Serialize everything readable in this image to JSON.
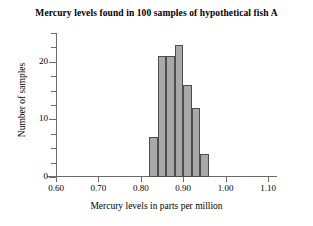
{
  "chart_data": {
    "type": "bar",
    "title": "Mercury levels found in 100 samples of hypothetical fish A",
    "xlabel": "Mercury levels in parts per million",
    "ylabel": "Number of samples",
    "xlim": [
      0.6,
      1.1
    ],
    "ylim": [
      0,
      25
    ],
    "grid": false,
    "legend": null,
    "bin_width": 0.02,
    "bin_starts": [
      0.82,
      0.84,
      0.86,
      0.88,
      0.9,
      0.92,
      0.94
    ],
    "categories": [
      "0.82-0.84",
      "0.84-0.86",
      "0.86-0.88",
      "0.88-0.90",
      "0.90-0.92",
      "0.92-0.94",
      "0.94-0.96"
    ],
    "values": [
      7,
      21,
      21,
      23,
      16,
      12,
      4
    ],
    "x_tick_labels": [
      "0.60",
      "0.70",
      "0.80",
      "0.90",
      "1.00",
      "1.10"
    ],
    "x_tick_values": [
      0.6,
      0.7,
      0.8,
      0.9,
      1.0,
      1.1
    ],
    "y_tick_labels": [
      "0",
      "10",
      "20"
    ],
    "y_tick_values": [
      0,
      10,
      20
    ],
    "y_minor_tick_values": [
      2.5,
      5,
      7.5,
      12.5,
      15,
      17.5,
      22.5,
      25
    ],
    "bar_fill_color": "#a8a8a8",
    "bar_edge_color": "#4d4d4d",
    "axis_color": "#6b6b6b"
  }
}
